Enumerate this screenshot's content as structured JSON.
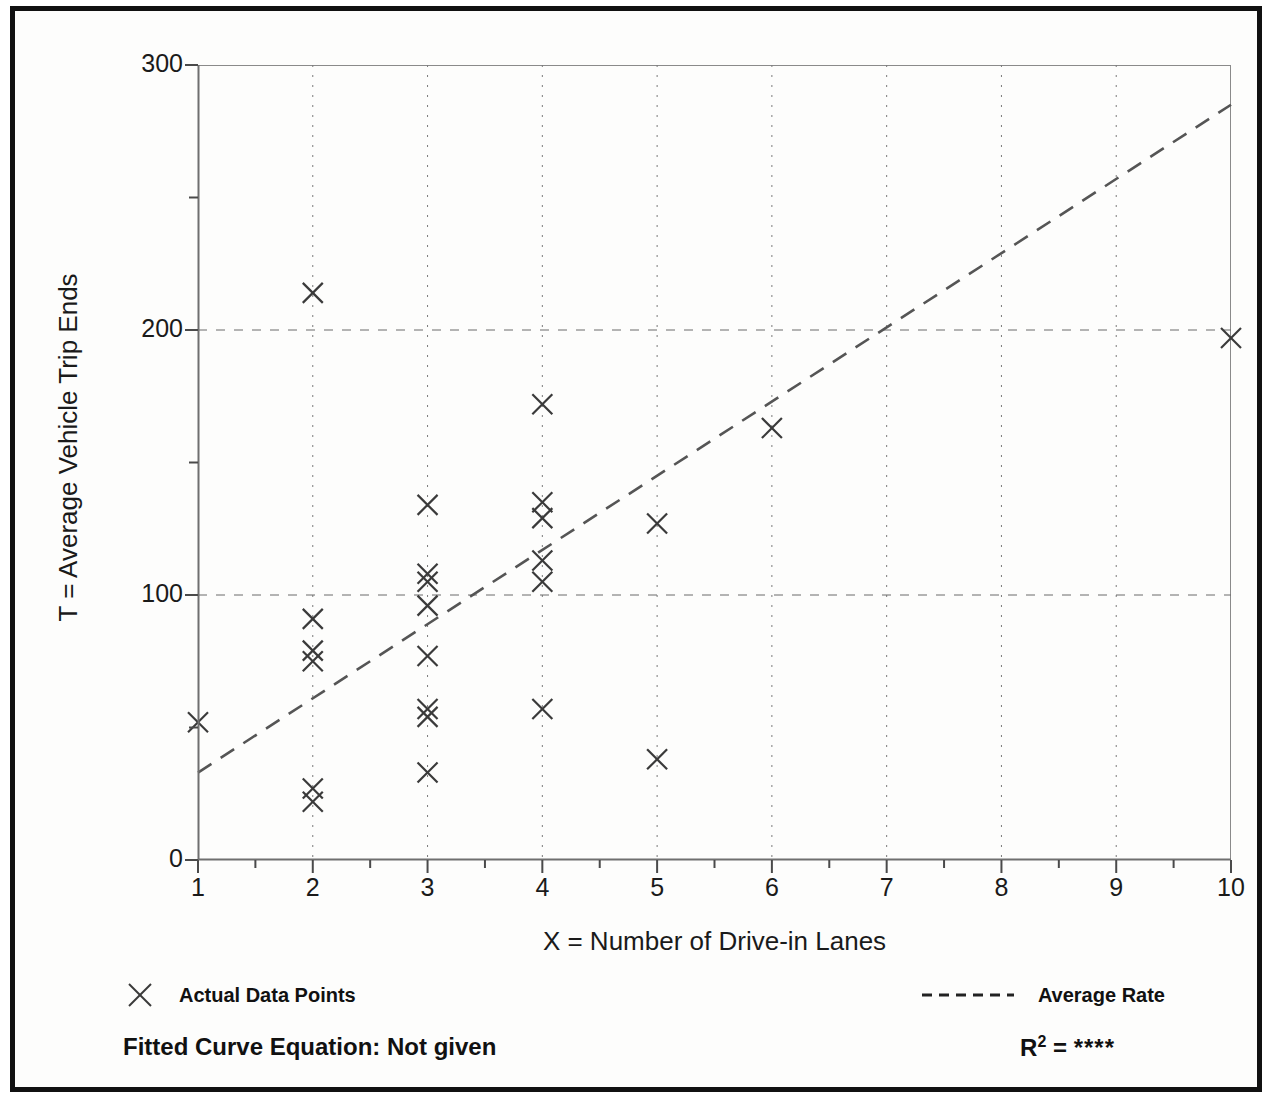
{
  "chart_data": {
    "type": "scatter",
    "title": "",
    "xlabel": "X = Number of Drive-in Lanes",
    "ylabel": "T = Average Vehicle Trip Ends",
    "xlim": [
      1,
      10
    ],
    "ylim": [
      0,
      300
    ],
    "xticks": [
      "1",
      "2",
      "3",
      "4",
      "5",
      "6",
      "7",
      "8",
      "9",
      "10"
    ],
    "yticks": [
      "0",
      "100",
      "200",
      "300"
    ],
    "y_minor_ticks": [
      50,
      150,
      250
    ],
    "grid": "dotted vertical at each integer x; dashed horizontal at 100 and 200",
    "legend_position": "below plot, left and right",
    "marker": "x",
    "series": [
      {
        "name": "Actual Data Points",
        "marker": "x",
        "points": [
          {
            "x": 1,
            "y": 52
          },
          {
            "x": 2,
            "y": 214
          },
          {
            "x": 2,
            "y": 91
          },
          {
            "x": 2,
            "y": 79
          },
          {
            "x": 2,
            "y": 75
          },
          {
            "x": 2,
            "y": 27
          },
          {
            "x": 2,
            "y": 22
          },
          {
            "x": 3,
            "y": 134
          },
          {
            "x": 3,
            "y": 108
          },
          {
            "x": 3,
            "y": 105
          },
          {
            "x": 3,
            "y": 96
          },
          {
            "x": 3,
            "y": 77
          },
          {
            "x": 3,
            "y": 57
          },
          {
            "x": 3,
            "y": 54
          },
          {
            "x": 3,
            "y": 33
          },
          {
            "x": 4,
            "y": 172
          },
          {
            "x": 4,
            "y": 135
          },
          {
            "x": 4,
            "y": 129
          },
          {
            "x": 4,
            "y": 113
          },
          {
            "x": 4,
            "y": 105
          },
          {
            "x": 4,
            "y": 57
          },
          {
            "x": 5,
            "y": 127
          },
          {
            "x": 5,
            "y": 38
          },
          {
            "x": 6,
            "y": 163
          },
          {
            "x": 10,
            "y": 197
          }
        ]
      },
      {
        "name": "Average Rate",
        "type": "line",
        "style": "dashed",
        "endpoints": [
          {
            "x": 1,
            "y": 33
          },
          {
            "x": 10,
            "y": 285
          }
        ]
      }
    ],
    "annotations": {
      "fitted_curve_equation": "Fitted Curve Equation:  Not given",
      "r_squared": {
        "prefix": "R",
        "exponent": "2",
        "equals": " = ",
        "value": "****"
      }
    }
  },
  "legend": {
    "left": {
      "marker": "x-marker-icon",
      "label": "Actual Data Points"
    },
    "right": {
      "marker": "dashed-line-icon",
      "label": "Average Rate"
    }
  },
  "footer": {
    "fitted_equation": "Fitted Curve Equation:  Not given",
    "r_label": "R",
    "r_exponent": "2",
    "r_equals": " = ",
    "r_value": "****"
  },
  "colors": {
    "frame": "#111111",
    "axis": "#8a8a8a",
    "marker": "#3a3a3a",
    "trend_line": "#555555",
    "text": "#1a1a1a",
    "background": "#fdfdfc"
  }
}
